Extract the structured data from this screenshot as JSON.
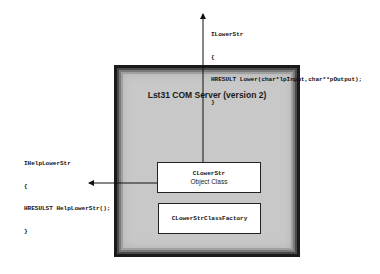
{
  "diagram": {
    "server": {
      "title": "Lst31 COM Server (version 2)"
    },
    "object_class_box": {
      "name": "CLowerStr",
      "subtitle": "Object Class"
    },
    "factory_box": {
      "name": "CLowerStrClassFactory"
    },
    "interfaces": [
      {
        "name": "ILowerStr",
        "open_brace": "{",
        "method": "HRESULT Lower(char*lpInput,char**pOutput);",
        "close_brace": "}"
      },
      {
        "name": "IHelpLowerStr",
        "open_brace": "{",
        "method": "HRESULST HelpLowerStr();",
        "close_brace": "}"
      }
    ],
    "colors": {
      "server_fill": "#c8c8c8",
      "border": "#1a1a1a",
      "box_fill": "#ffffff",
      "line": "#111111"
    }
  }
}
